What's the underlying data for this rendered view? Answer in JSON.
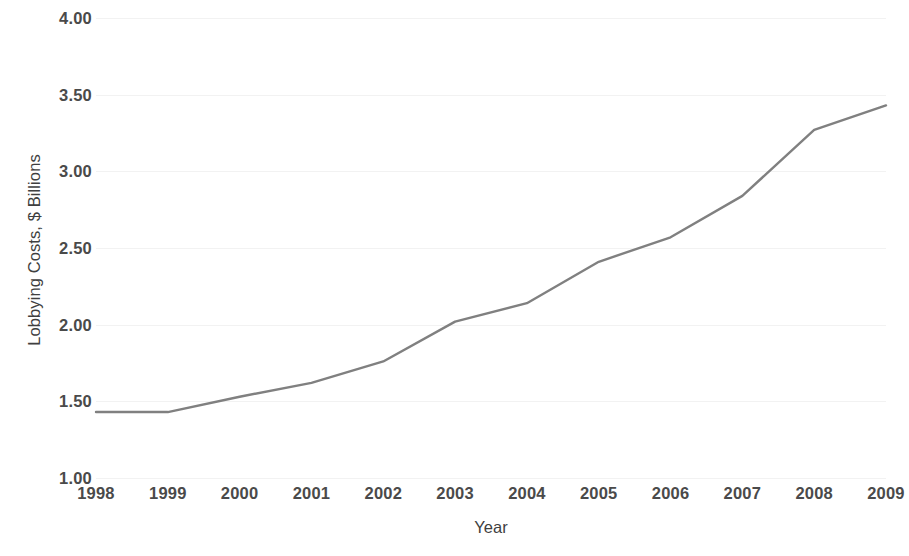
{
  "chart_data": {
    "type": "line",
    "title": "",
    "subtitle": "",
    "xlabel": "Year",
    "ylabel": "Lobbying Costs, $ Billions",
    "categories": [
      "1998",
      "1999",
      "2000",
      "2001",
      "2002",
      "2003",
      "2004",
      "2005",
      "2006",
      "2007",
      "2008",
      "2009"
    ],
    "values": [
      1.43,
      1.43,
      1.53,
      1.62,
      1.76,
      2.02,
      2.14,
      2.41,
      2.57,
      2.84,
      3.27,
      3.43
    ],
    "series": [
      {
        "name": "Lobbying Costs",
        "values": [
          1.43,
          1.43,
          1.53,
          1.62,
          1.76,
          2.02,
          2.14,
          2.41,
          2.57,
          2.84,
          3.27,
          3.43
        ]
      }
    ],
    "ylim": [
      1.0,
      4.0
    ],
    "ytick_step": 0.5,
    "ytick_labels": [
      "1.00",
      "1.50",
      "2.00",
      "2.50",
      "3.00",
      "3.50",
      "4.00"
    ],
    "ytick_values": [
      1.0,
      1.5,
      2.0,
      2.5,
      3.0,
      3.5,
      4.0
    ],
    "xtick_labels": [
      "1998",
      "1999",
      "2000",
      "2001",
      "2002",
      "2003",
      "2004",
      "2005",
      "2006",
      "2007",
      "2008",
      "2009"
    ],
    "grid": "horizontal",
    "legend": "none",
    "legend_position": "",
    "annotations": [],
    "line_color": "#808080",
    "gridline_color": "#f2f2f2",
    "label_color": "#4a4a4a",
    "axis_title_color": "#3f3f3f",
    "background_color": "#ffffff",
    "line_width": 2.4,
    "markers": "none"
  }
}
